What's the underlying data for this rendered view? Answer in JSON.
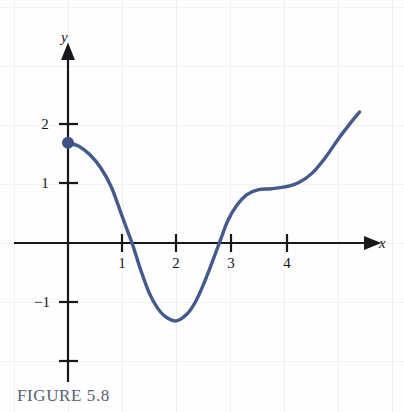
{
  "figure": {
    "caption": "FIGURE 5.8",
    "caption_color": "#566274"
  },
  "axes": {
    "x_axis_label": "x",
    "y_axis_label": "y",
    "x_tick_labels": [
      "1",
      "2",
      "3",
      "4"
    ],
    "y_tick_labels": [
      "2",
      "1",
      "−1"
    ]
  },
  "chart_data": {
    "type": "line",
    "title": "FIGURE 5.8",
    "xlabel": "x",
    "ylabel": "y",
    "grid": true,
    "legend": "none",
    "xlim": [
      -0.35,
      5.6
    ],
    "ylim": [
      -2.4,
      2.6
    ],
    "xticks": [
      1,
      2,
      3,
      4
    ],
    "xtick_labels": [
      "1",
      "2",
      "3",
      "4"
    ],
    "yticks": [
      2,
      1,
      -1,
      -2
    ],
    "ytick_labels": [
      "2",
      "1",
      "−1",
      ""
    ],
    "series": [
      {
        "name": "curve",
        "color": "#44598c",
        "line_width": 3.4,
        "x": [
          0.0,
          0.2,
          0.4,
          0.6,
          0.8,
          1.0,
          1.1,
          1.2,
          1.35,
          1.5,
          1.65,
          1.8,
          2.0,
          2.2,
          2.35,
          2.5,
          2.65,
          2.8,
          2.95,
          3.1,
          3.3,
          3.5,
          3.75,
          4.0,
          4.25,
          4.5,
          4.75,
          5.0,
          5.2,
          5.38
        ],
        "y": [
          1.7,
          1.64,
          1.5,
          1.28,
          0.95,
          0.45,
          0.2,
          -0.05,
          -0.48,
          -0.85,
          -1.1,
          -1.25,
          -1.32,
          -1.2,
          -1.0,
          -0.7,
          -0.35,
          0.02,
          0.38,
          0.62,
          0.82,
          0.9,
          0.92,
          0.95,
          1.02,
          1.18,
          1.45,
          1.78,
          2.02,
          2.22
        ]
      }
    ],
    "points": [
      {
        "name": "y-intercept-dot",
        "x": 0,
        "y": 1.7,
        "color": "#3a5287",
        "radius": 6
      }
    ],
    "annotations": {
      "zeros": [
        1.2,
        2.8
      ],
      "minimum": {
        "x": 2.0,
        "y": -1.32
      },
      "start_point": {
        "x": 0,
        "y": 1.7
      },
      "end_point": {
        "x": 5.38,
        "y": 2.22
      }
    }
  }
}
